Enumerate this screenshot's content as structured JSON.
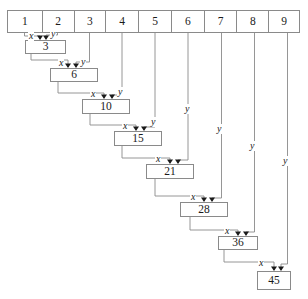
{
  "diagram": {
    "line_color": "#8a8a8a",
    "text_color": "#1a1a1a",
    "background": "#ffffff",
    "index_row": {
      "name": "index-table",
      "cells": [
        {
          "label": "1",
          "x": 7,
          "w": 35
        },
        {
          "label": "2",
          "x": 42,
          "w": 32
        },
        {
          "label": "3",
          "x": 74,
          "w": 32
        },
        {
          "label": "4",
          "x": 106,
          "w": 33
        },
        {
          "label": "5",
          "x": 139,
          "w": 33
        },
        {
          "label": "6",
          "x": 172,
          "w": 33
        },
        {
          "label": "7",
          "x": 205,
          "w": 33
        },
        {
          "label": "8",
          "x": 238,
          "w": 32
        },
        {
          "label": "9",
          "x": 270,
          "w": 30
        }
      ]
    },
    "sum_boxes": [
      {
        "label": "3",
        "x": 25,
        "y": 40,
        "w": 41,
        "h": 14
      },
      {
        "label": "6",
        "x": 50,
        "y": 68,
        "w": 48,
        "h": 14
      },
      {
        "label": "10",
        "x": 82,
        "y": 99,
        "w": 48,
        "h": 15
      },
      {
        "label": "15",
        "x": 114,
        "y": 131,
        "w": 48,
        "h": 15
      },
      {
        "label": "21",
        "x": 146,
        "y": 164,
        "w": 48,
        "h": 15
      },
      {
        "label": "28",
        "x": 180,
        "y": 202,
        "w": 48,
        "h": 15
      },
      {
        "label": "36",
        "x": 218,
        "y": 236,
        "w": 40,
        "h": 14
      },
      {
        "label": "45",
        "x": 257,
        "y": 271,
        "w": 34,
        "h": 19
      }
    ],
    "port_labels": [
      {
        "kind": "x",
        "text": "x",
        "x": 28,
        "y": 31
      },
      {
        "kind": "y",
        "text": "y",
        "x": 50,
        "y": 29
      },
      {
        "kind": "x",
        "text": "x",
        "x": 58,
        "y": 58
      },
      {
        "kind": "y",
        "text": "y",
        "x": 80,
        "y": 57
      },
      {
        "kind": "x",
        "text": "x",
        "x": 90,
        "y": 89
      },
      {
        "kind": "y",
        "text": "y",
        "x": 117,
        "y": 87
      },
      {
        "kind": "x",
        "text": "x",
        "x": 122,
        "y": 121
      },
      {
        "kind": "y",
        "text": "y",
        "x": 150,
        "y": 117
      },
      {
        "kind": "x",
        "text": "x",
        "x": 155,
        "y": 154
      },
      {
        "kind": "y",
        "text": "y",
        "x": 184,
        "y": 104
      },
      {
        "kind": "x",
        "text": "x",
        "x": 190,
        "y": 192
      },
      {
        "kind": "y",
        "text": "y",
        "x": 216,
        "y": 124
      },
      {
        "kind": "x",
        "text": "x",
        "x": 224,
        "y": 226
      },
      {
        "kind": "y",
        "text": "y",
        "x": 249,
        "y": 141
      },
      {
        "kind": "x",
        "text": "x",
        "x": 258,
        "y": 258
      },
      {
        "kind": "y",
        "text": "y",
        "x": 282,
        "y": 156
      }
    ],
    "wire_paths": [
      "M 24.5 33 L 24.5 36 L 40 36 L 40 39",
      "M 57.5 33 L 57.5 35 L 46 35 L 46 39",
      "M 31 54 L 31 60 L 68 60 L 68 67",
      "M 89.5 33 L 89.5 62 L 76 62 L 76 67",
      "M 58 82 L 58 93 L 104 93 L 104 98",
      "M 122 33 L 122 95 L 112 95 L 112 98",
      "M 90 114 L 90 125 L 136 125 L 136 130",
      "M 155 33 L 155 127 L 144 127 L 144 130",
      "M 122 146 L 122 158 L 170 158 L 170 163",
      "M 188 33 L 188 160 L 178 160 L 178 163",
      "M 155 179 L 155 196 L 204 196 L 204 201",
      "M 221.5 33 L 221.5 198 L 212 198 L 212 201",
      "M 190 217 L 190 230 L 238 230 L 238 235",
      "M 254.5 33 L 254.5 232 L 246 232 L 246 235",
      "M 224 250 L 224 262 L 274 262 L 274 270",
      "M 287.5 33 L 287.5 264 L 281 264 L 281 270"
    ],
    "arrow_heads": [
      {
        "x": 40,
        "y": 40
      },
      {
        "x": 46,
        "y": 40
      },
      {
        "x": 68,
        "y": 68
      },
      {
        "x": 76,
        "y": 68
      },
      {
        "x": 104,
        "y": 99
      },
      {
        "x": 112,
        "y": 99
      },
      {
        "x": 136,
        "y": 131
      },
      {
        "x": 144,
        "y": 131
      },
      {
        "x": 170,
        "y": 164
      },
      {
        "x": 178,
        "y": 164
      },
      {
        "x": 204,
        "y": 202
      },
      {
        "x": 212,
        "y": 202
      },
      {
        "x": 238,
        "y": 236
      },
      {
        "x": 246,
        "y": 236
      },
      {
        "x": 274,
        "y": 271
      },
      {
        "x": 281,
        "y": 271
      }
    ]
  }
}
